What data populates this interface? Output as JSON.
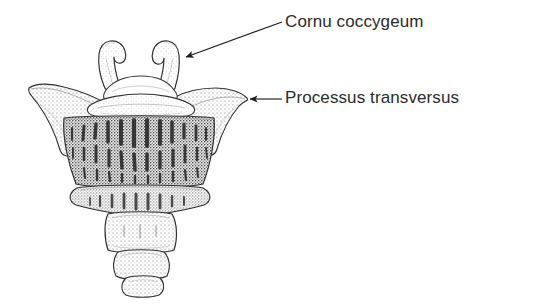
{
  "figure": {
    "kind": "anatomical-line-drawing",
    "view": "anterior",
    "background_color": "#ffffff",
    "ink_color": "#2b2b2b",
    "stipple_color": "#555555",
    "width": 536,
    "height": 308
  },
  "labels": [
    {
      "id": "cornu-coccygeum",
      "text": "Cornu coccygeum",
      "x": 285,
      "y": 13,
      "font_size": 17,
      "color": "#2b2b2b"
    },
    {
      "id": "processus-transversus",
      "text": "Processus transversus",
      "x": 285,
      "y": 89,
      "font_size": 17,
      "color": "#2b2b2b"
    }
  ],
  "leaders": [
    {
      "id": "leader-cornu-coccygeum",
      "target": "cornu-coccygeum",
      "from_x": 282,
      "from_y": 22,
      "to_x": 184,
      "to_y": 58,
      "arrow": "triangle",
      "direction": "down-left"
    },
    {
      "id": "leader-processus-transversus",
      "target": "processus-transversus",
      "from_x": 282,
      "from_y": 99,
      "to_x": 248,
      "to_y": 99,
      "arrow": "triangle",
      "direction": "left"
    }
  ],
  "bone_parts": [
    {
      "id": "cornu-left",
      "name": "left coccygeal cornu",
      "note": "upward hooked horn with clubbed tip"
    },
    {
      "id": "cornu-right",
      "name": "right coccygeal cornu",
      "note": "upward hooked horn, arrow target"
    },
    {
      "id": "transverse-process-left",
      "name": "left transverse process",
      "note": "lateral wing tip near x=28"
    },
    {
      "id": "transverse-process-right",
      "name": "right transverse process",
      "note": "lateral wing tip near x=248"
    },
    {
      "id": "arch-band",
      "name": "upper arch band",
      "note": "light rounded band above vertebral body"
    },
    {
      "id": "segment-co1",
      "name": "first coccygeal segment",
      "note": "widest, vertical trabecular striations"
    },
    {
      "id": "segment-co2",
      "name": "second coccygeal segment",
      "note": "narrower rounded block"
    },
    {
      "id": "segment-co3",
      "name": "third coccygeal segment",
      "note": "small rounded block"
    },
    {
      "id": "segment-co4",
      "name": "fourth coccygeal segment",
      "note": "terminal tip, smallest"
    }
  ]
}
